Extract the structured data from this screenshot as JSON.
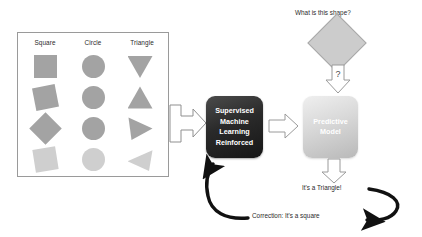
{
  "training_panel": {
    "columns": [
      {
        "label": "Square"
      },
      {
        "label": "Circle"
      },
      {
        "label": "Triangle"
      }
    ],
    "rows": [
      {
        "square": "square",
        "circle": "circle",
        "triangle": "triangle-down"
      },
      {
        "square": "square-rotated",
        "circle": "circle",
        "triangle": "triangle-up"
      },
      {
        "square": "square-diamond",
        "circle": "circle",
        "triangle": "triangle-right"
      },
      {
        "square": "square-tilted-pale",
        "circle": "circle-pale",
        "triangle": "triangle-left-pale"
      }
    ]
  },
  "training_box": {
    "lines": [
      "Supervised",
      "Machine",
      "Learning",
      "Reinforced"
    ]
  },
  "predictive_box": {
    "lines": [
      "Predictive",
      "Model"
    ]
  },
  "query": {
    "question": "What is this shape?",
    "shape": "diamond",
    "arrow_symbol": "?"
  },
  "outputs": {
    "prediction": "It's a Triangle!",
    "correction": "Correction: It's a square"
  },
  "icons": {
    "data_to_training": "right-arrow-icon",
    "training_to_model": "right-arrow-icon",
    "query_to_model": "down-arrow-question-icon",
    "model_to_output": "down-arrow-icon",
    "feedback_loop": "curved-feedback-arrow-icon"
  },
  "colors": {
    "shape_fill": "#a3a3a3",
    "shape_fill_pale": "#cfcfcf",
    "training_box": "#2a2a2a",
    "predictive_box": "#d8d8d8",
    "panel_border": "#9a9a9a",
    "text": "#2b2b2b",
    "feedback_arrow": "#111111"
  }
}
